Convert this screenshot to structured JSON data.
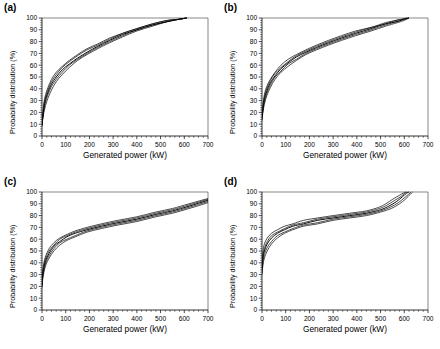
{
  "figure": {
    "panels": [
      {
        "id": "a",
        "label": "(a)",
        "xlabel": "Generated power (kW)",
        "ylabel": "Probability distribution (%)"
      },
      {
        "id": "b",
        "label": "(b)",
        "xlabel": "Generated power (kW)",
        "ylabel": "Probability distribution (%)"
      },
      {
        "id": "c",
        "label": "(c)",
        "xlabel": "Generated power (kW)",
        "ylabel": "Probability distribution (%)"
      },
      {
        "id": "d",
        "label": "(d)",
        "xlabel": "Generated power (kW)",
        "ylabel": "Probability distribution (%)"
      }
    ]
  },
  "chart_data": [
    {
      "type": "line",
      "panel": "a",
      "title": "(a)",
      "xlabel": "Generated power (kW)",
      "ylabel": "Probability distribution (%)",
      "xlim": [
        0,
        700
      ],
      "ylim": [
        0,
        100
      ],
      "xticks": [
        0,
        100,
        200,
        300,
        400,
        500,
        600,
        700
      ],
      "yticks": [
        0,
        10,
        20,
        30,
        40,
        50,
        60,
        70,
        80,
        90,
        100
      ],
      "grid": false,
      "legend": "none",
      "annotations": [
        "5 overlapping empirical CDF curves forming a narrow band",
        "band widest between 20% and 55%",
        "all curves converge to 100% near 610 kW"
      ],
      "series": [
        {
          "name": "curve-1",
          "x": [
            0,
            3,
            8,
            15,
            25,
            40,
            60,
            85,
            115,
            150,
            190,
            235,
            285,
            340,
            400,
            465,
            530,
            580,
            610
          ],
          "values": [
            9,
            14,
            20,
            26,
            32,
            39,
            46,
            52,
            58,
            64,
            69,
            74,
            79,
            84,
            89,
            93,
            97,
            99,
            100
          ]
        },
        {
          "name": "curve-2",
          "x": [
            0,
            3,
            8,
            15,
            25,
            40,
            60,
            85,
            115,
            150,
            190,
            235,
            285,
            340,
            400,
            465,
            530,
            580,
            610
          ],
          "values": [
            9,
            15,
            22,
            29,
            35,
            42,
            48,
            54,
            60,
            65,
            70,
            75,
            80,
            85,
            90,
            94,
            97,
            99,
            100
          ]
        },
        {
          "name": "curve-3",
          "x": [
            0,
            3,
            8,
            15,
            25,
            40,
            60,
            85,
            115,
            150,
            190,
            235,
            285,
            340,
            400,
            465,
            530,
            580,
            610
          ],
          "values": [
            9,
            16,
            24,
            31,
            37,
            44,
            50,
            56,
            61,
            66,
            71,
            76,
            81,
            86,
            90,
            94,
            97,
            99,
            100
          ]
        },
        {
          "name": "curve-4",
          "x": [
            0,
            3,
            8,
            15,
            25,
            40,
            60,
            85,
            115,
            150,
            190,
            235,
            285,
            340,
            400,
            465,
            530,
            580,
            610
          ],
          "values": [
            9,
            17,
            26,
            33,
            39,
            46,
            52,
            58,
            63,
            68,
            73,
            77,
            82,
            87,
            91,
            95,
            98,
            99,
            100
          ]
        },
        {
          "name": "curve-5",
          "x": [
            0,
            3,
            8,
            15,
            25,
            40,
            60,
            85,
            115,
            150,
            190,
            235,
            285,
            340,
            400,
            465,
            530,
            580,
            610
          ],
          "values": [
            9,
            18,
            28,
            35,
            41,
            48,
            54,
            59,
            64,
            69,
            74,
            78,
            83,
            87,
            91,
            95,
            98,
            99,
            100
          ]
        }
      ]
    },
    {
      "type": "line",
      "panel": "b",
      "title": "(b)",
      "xlabel": "Generated power (kW)",
      "ylabel": "Probability distribution (%)",
      "xlim": [
        0,
        700
      ],
      "ylim": [
        0,
        100
      ],
      "xticks": [
        0,
        100,
        200,
        300,
        400,
        500,
        600,
        700
      ],
      "yticks": [
        0,
        10,
        20,
        30,
        40,
        50,
        60,
        70,
        80,
        90,
        100
      ],
      "grid": false,
      "legend": "none",
      "annotations": [
        "5 overlapping empirical CDF curves",
        "tight band, slight spread near 30-50%",
        "small divergence near the 95-100% top, reaching 100% between 595 and 625 kW"
      ],
      "series": [
        {
          "name": "curve-1",
          "x": [
            0,
            4,
            10,
            20,
            35,
            55,
            80,
            110,
            145,
            185,
            230,
            280,
            335,
            395,
            460,
            520,
            570,
            600,
            620
          ],
          "values": [
            13,
            20,
            27,
            34,
            41,
            48,
            54,
            59,
            64,
            69,
            73,
            77,
            81,
            85,
            89,
            93,
            96,
            98,
            100
          ]
        },
        {
          "name": "curve-2",
          "x": [
            0,
            4,
            10,
            20,
            35,
            55,
            80,
            110,
            145,
            185,
            230,
            280,
            335,
            395,
            460,
            520,
            570,
            600,
            620
          ],
          "values": [
            14,
            22,
            29,
            36,
            43,
            50,
            55,
            61,
            65,
            70,
            74,
            78,
            82,
            86,
            90,
            94,
            97,
            99,
            100
          ]
        },
        {
          "name": "curve-3",
          "x": [
            0,
            4,
            10,
            20,
            35,
            55,
            80,
            110,
            145,
            185,
            230,
            280,
            335,
            395,
            460,
            520,
            570,
            600,
            620
          ],
          "values": [
            15,
            23,
            31,
            38,
            45,
            51,
            57,
            62,
            67,
            71,
            75,
            79,
            83,
            87,
            91,
            95,
            97,
            99,
            100
          ]
        },
        {
          "name": "curve-4",
          "x": [
            0,
            4,
            10,
            20,
            35,
            55,
            80,
            110,
            145,
            185,
            230,
            280,
            335,
            395,
            460,
            520,
            565,
            595,
            615
          ],
          "values": [
            16,
            25,
            33,
            40,
            47,
            53,
            58,
            63,
            68,
            72,
            76,
            80,
            84,
            88,
            92,
            95,
            98,
            99,
            100
          ]
        },
        {
          "name": "curve-5",
          "x": [
            0,
            4,
            10,
            20,
            35,
            55,
            80,
            110,
            145,
            185,
            230,
            280,
            335,
            395,
            460,
            520,
            565,
            590,
            610
          ],
          "values": [
            17,
            26,
            35,
            42,
            48,
            54,
            60,
            65,
            69,
            73,
            77,
            81,
            85,
            89,
            92,
            96,
            98,
            99,
            100
          ]
        }
      ]
    },
    {
      "type": "line",
      "panel": "c",
      "title": "(c)",
      "xlabel": "Generated power (kW)",
      "ylabel": "Probability distribution (%)",
      "xlim": [
        0,
        700
      ],
      "ylim": [
        0,
        100
      ],
      "xticks": [
        0,
        100,
        200,
        300,
        400,
        500,
        600,
        700
      ],
      "yticks": [
        0,
        10,
        20,
        30,
        40,
        50,
        60,
        70,
        80,
        90,
        100
      ],
      "grid": false,
      "legend": "none",
      "annotations": [
        "5 overlapping curves with an S-shape",
        "steep rise to about 60% by 100 kW",
        "gentle plateau slope from 65% to 85% between 150 and 500 kW",
        "sharp final rise to 100% near 800-830 kW, beyond the 700 tick"
      ],
      "series": [
        {
          "name": "curve-1",
          "x": [
            0,
            3,
            8,
            16,
            30,
            50,
            75,
            105,
            140,
            190,
            250,
            320,
            400,
            480,
            550,
            620,
            700,
            770,
            810
          ],
          "values": [
            19,
            26,
            32,
            38,
            44,
            50,
            55,
            59,
            62,
            66,
            69,
            72,
            75,
            79,
            82,
            86,
            91,
            97,
            100
          ]
        },
        {
          "name": "curve-2",
          "x": [
            0,
            3,
            8,
            16,
            30,
            50,
            75,
            105,
            140,
            190,
            250,
            320,
            400,
            480,
            550,
            620,
            700,
            775,
            815
          ],
          "values": [
            20,
            28,
            34,
            40,
            46,
            52,
            57,
            60,
            63,
            67,
            70,
            73,
            76,
            80,
            83,
            87,
            92,
            97,
            100
          ]
        },
        {
          "name": "curve-3",
          "x": [
            0,
            3,
            8,
            16,
            30,
            50,
            75,
            105,
            140,
            190,
            250,
            320,
            400,
            480,
            550,
            620,
            700,
            780,
            820
          ],
          "values": [
            21,
            29,
            36,
            42,
            48,
            54,
            58,
            62,
            65,
            68,
            71,
            74,
            77,
            81,
            84,
            88,
            93,
            98,
            100
          ]
        },
        {
          "name": "curve-4",
          "x": [
            0,
            3,
            8,
            16,
            30,
            50,
            75,
            105,
            140,
            190,
            250,
            320,
            400,
            480,
            550,
            620,
            705,
            785,
            825
          ],
          "values": [
            22,
            31,
            38,
            44,
            50,
            55,
            60,
            63,
            66,
            69,
            72,
            75,
            78,
            82,
            85,
            89,
            94,
            98,
            100
          ]
        },
        {
          "name": "curve-5",
          "x": [
            0,
            3,
            8,
            16,
            30,
            50,
            75,
            105,
            140,
            190,
            250,
            320,
            400,
            480,
            550,
            620,
            710,
            790,
            830
          ],
          "values": [
            23,
            33,
            40,
            46,
            52,
            57,
            61,
            64,
            67,
            70,
            73,
            76,
            79,
            83,
            86,
            90,
            95,
            99,
            100
          ]
        }
      ]
    },
    {
      "type": "line",
      "panel": "d",
      "title": "(d)",
      "xlabel": "Generated power (kW)",
      "ylabel": "Probability distribution (%)",
      "xlim": [
        0,
        700
      ],
      "ylim": [
        0,
        100
      ],
      "xticks": [
        0,
        100,
        200,
        300,
        400,
        500,
        600,
        700
      ],
      "yticks": [
        0,
        10,
        20,
        30,
        40,
        50,
        60,
        70,
        80,
        90,
        100
      ],
      "grid": false,
      "legend": "none",
      "annotations": [
        "5 overlapping curves with a pronounced plateau",
        "intercept band at x=0 spans roughly 30% to 45%",
        "long flat section between 70% and 82% from 150 to 480 kW",
        "curves fan apart above 85% then converge to 100% between 595 and 635 kW"
      ],
      "series": [
        {
          "name": "curve-1",
          "x": [
            0,
            4,
            10,
            22,
            40,
            65,
            95,
            130,
            175,
            235,
            300,
            370,
            440,
            500,
            545,
            580,
            605,
            625,
            635
          ],
          "values": [
            30,
            38,
            44,
            50,
            56,
            61,
            65,
            68,
            71,
            73,
            76,
            78,
            80,
            83,
            86,
            90,
            94,
            98,
            100
          ]
        },
        {
          "name": "curve-2",
          "x": [
            0,
            4,
            10,
            22,
            40,
            65,
            95,
            130,
            175,
            235,
            300,
            370,
            440,
            500,
            540,
            575,
            600,
            618,
            628
          ],
          "values": [
            32,
            41,
            47,
            53,
            58,
            63,
            66,
            69,
            72,
            74,
            77,
            79,
            81,
            84,
            87,
            91,
            95,
            98,
            100
          ]
        },
        {
          "name": "curve-3",
          "x": [
            0,
            4,
            10,
            22,
            40,
            65,
            95,
            130,
            175,
            235,
            300,
            370,
            440,
            500,
            535,
            568,
            592,
            610,
            620
          ],
          "values": [
            35,
            44,
            50,
            56,
            61,
            65,
            68,
            71,
            73,
            76,
            78,
            80,
            82,
            85,
            88,
            92,
            96,
            99,
            100
          ]
        },
        {
          "name": "curve-4",
          "x": [
            0,
            4,
            10,
            22,
            40,
            65,
            95,
            130,
            175,
            235,
            300,
            370,
            440,
            495,
            528,
            560,
            585,
            602,
            612
          ],
          "values": [
            38,
            46,
            52,
            58,
            63,
            66,
            69,
            72,
            74,
            77,
            79,
            81,
            83,
            86,
            89,
            93,
            96,
            99,
            100
          ]
        },
        {
          "name": "curve-5",
          "x": [
            0,
            4,
            10,
            22,
            40,
            65,
            95,
            130,
            175,
            235,
            300,
            370,
            440,
            492,
            522,
            552,
            578,
            595,
            605
          ],
          "values": [
            42,
            50,
            56,
            61,
            65,
            68,
            71,
            73,
            76,
            78,
            80,
            82,
            84,
            87,
            90,
            94,
            97,
            99,
            100
          ]
        }
      ]
    }
  ]
}
